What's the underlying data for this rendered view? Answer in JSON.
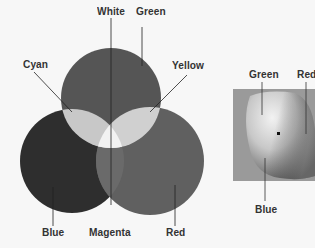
{
  "venn": {
    "title": "Additive color mixing",
    "circles": [
      {
        "name": "Green",
        "color": "#555555"
      },
      {
        "name": "Blue",
        "color": "#2e2e2e"
      },
      {
        "name": "Red",
        "color": "#606060"
      }
    ],
    "overlaps": [
      {
        "name": "Cyan",
        "color": "#c8c8c8"
      },
      {
        "name": "Yellow",
        "color": "#cfcfcf"
      },
      {
        "name": "Magenta",
        "color": "#6a6a6a"
      },
      {
        "name": "White",
        "color": "#f0f0f0"
      }
    ],
    "labels": {
      "white": "White",
      "green": "Green",
      "cyan": "Cyan",
      "yellow": "Yellow",
      "blue": "Blue",
      "magenta": "Magenta",
      "red": "Red"
    }
  },
  "wheel": {
    "title": "Color picker wheel",
    "background": "#9a9a9a",
    "labels": {
      "green": "Green",
      "red": "Red",
      "blue": "Blue"
    }
  }
}
